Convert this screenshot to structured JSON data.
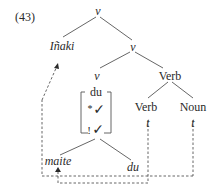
{
  "example_number": "(43)",
  "tree": {
    "root": "v",
    "left_spec": "Iñaki",
    "vprime": "v",
    "v_head": "v",
    "verb_phrase": "Verb",
    "verb": "Verb",
    "noun": "Noun",
    "trace_verb": "t",
    "trace_noun": "t"
  },
  "bracket": {
    "top": "du",
    "middle_mark": "*",
    "middle_check": "✓",
    "bottom_mark": "!",
    "bottom_check": "✓"
  },
  "leaves": {
    "left": "maite",
    "right": "du"
  },
  "colors": {
    "ink": "#2a2a2a",
    "line": "#555555"
  }
}
